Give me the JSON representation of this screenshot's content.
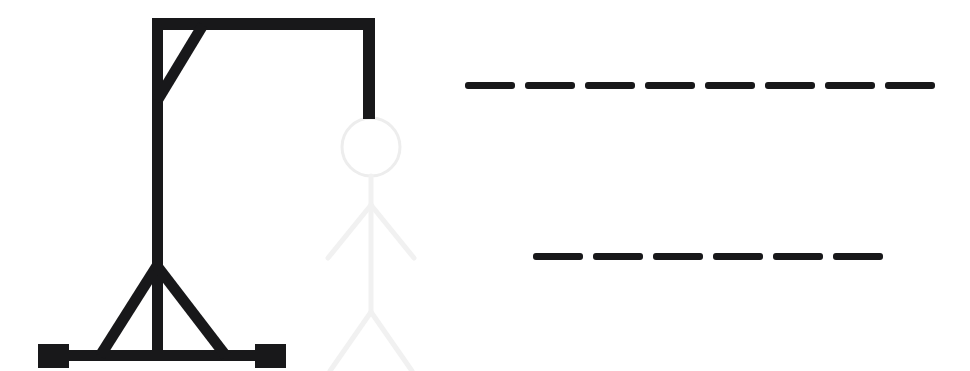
{
  "app": {
    "title": "Hangman",
    "background_color": "#ffffff"
  },
  "gallows": {
    "name": "hangman-gallows",
    "stroke_color": "#18181a",
    "parts": [
      {
        "id": "base-bar",
        "label": "base bar",
        "drawn": true
      },
      {
        "id": "base-foot-left",
        "label": "left foot block",
        "drawn": true
      },
      {
        "id": "base-foot-right",
        "label": "right foot block",
        "drawn": true
      },
      {
        "id": "upright-post",
        "label": "upright post",
        "drawn": true
      },
      {
        "id": "brace-left",
        "label": "left base brace",
        "drawn": true
      },
      {
        "id": "brace-right",
        "label": "right base brace",
        "drawn": true
      },
      {
        "id": "top-beam",
        "label": "top beam",
        "drawn": true
      },
      {
        "id": "top-brace",
        "label": "top diagonal brace",
        "drawn": true
      },
      {
        "id": "rope",
        "label": "rope",
        "drawn": true
      }
    ]
  },
  "figure": {
    "name": "hangman-figure",
    "stroke_color": "#f1f1f1",
    "head_color": "#ededed",
    "state": "ghosted",
    "parts": [
      {
        "id": "head",
        "label": "head",
        "revealed": false
      },
      {
        "id": "body",
        "label": "body",
        "revealed": false
      },
      {
        "id": "arm-left",
        "label": "left arm",
        "revealed": false
      },
      {
        "id": "arm-right",
        "label": "right arm",
        "revealed": false
      },
      {
        "id": "leg-left",
        "label": "left leg",
        "revealed": false
      },
      {
        "id": "leg-right",
        "label": "right leg",
        "revealed": false
      }
    ]
  },
  "word": {
    "name": "hangman-word",
    "blank_color": "#18181a",
    "rows": [
      {
        "index": 0,
        "blank_count": 8,
        "letters": [
          "",
          "",
          "",
          "",
          "",
          "",
          "",
          ""
        ]
      },
      {
        "index": 1,
        "blank_count": 6,
        "letters": [
          "",
          "",
          "",
          "",
          "",
          ""
        ]
      }
    ]
  }
}
